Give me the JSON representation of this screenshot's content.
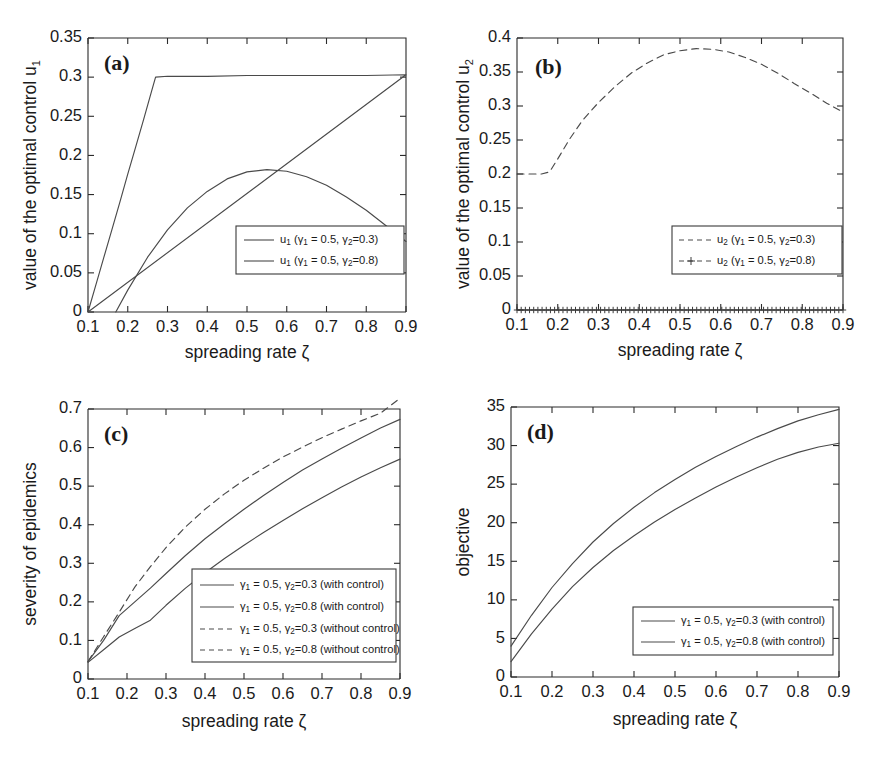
{
  "figure": {
    "title": "",
    "panels": [
      "a",
      "b",
      "c",
      "d"
    ]
  },
  "labels": {
    "xaxis": "spreading rate ζ",
    "panel_a_tag": "(a)",
    "panel_b_tag": "(b)",
    "panel_c_tag": "(c)",
    "panel_d_tag": "(d)",
    "yaxis_a": "value of the optimal control u",
    "yaxis_a_sub": "1",
    "yaxis_b": "value of the optimal control u",
    "yaxis_b_sub": "2",
    "yaxis_c": "severity of epidemics",
    "yaxis_d": "objective"
  },
  "colors": {
    "axis": "#2b2b2b",
    "curve": "#4a4a4a",
    "background": "#ffffff",
    "text": "#1a1a1a"
  },
  "chart_data": [
    {
      "id": "panel-a",
      "type": "line",
      "title": "(a)",
      "xlabel": "spreading rate ζ",
      "ylabel": "value of the optimal control u₁",
      "xlim": [
        0.1,
        0.9
      ],
      "ylim": [
        0,
        0.35
      ],
      "xticks": [
        "0.1",
        "0.2",
        "0.3",
        "0.4",
        "0.5",
        "0.6",
        "0.7",
        "0.8",
        "0.9"
      ],
      "yticks": [
        "0",
        "0.05",
        "0.1",
        "0.15",
        "0.2",
        "0.25",
        "0.3",
        "0.35"
      ],
      "grid": false,
      "legend_position": "lower-right",
      "series": [
        {
          "name": "u₁ (γ₁ = 0.5, γ₂=0.3)",
          "style": "solid",
          "x": [
            0.1,
            0.12,
            0.14,
            0.16,
            0.18,
            0.2,
            0.22,
            0.24,
            0.26,
            0.27,
            0.3,
            0.4,
            0.5,
            0.6,
            0.7,
            0.8,
            0.9
          ],
          "y": [
            0.0,
            0.035,
            0.07,
            0.105,
            0.14,
            0.176,
            0.211,
            0.246,
            0.282,
            0.3,
            0.301,
            0.301,
            0.302,
            0.302,
            0.302,
            0.302,
            0.303
          ]
        },
        {
          "name": "u₁ (γ₁ = 0.5, γ₂=0.8)",
          "style": "solid",
          "x": [
            0.17,
            0.2,
            0.25,
            0.3,
            0.35,
            0.4,
            0.45,
            0.5,
            0.55,
            0.6,
            0.65,
            0.7,
            0.75,
            0.8,
            0.85,
            0.9
          ],
          "y": [
            0.0,
            0.028,
            0.07,
            0.105,
            0.133,
            0.154,
            0.17,
            0.179,
            0.182,
            0.18,
            0.173,
            0.162,
            0.147,
            0.13,
            0.11,
            0.09
          ]
        }
      ]
    },
    {
      "id": "panel-b",
      "type": "line",
      "title": "(b)",
      "xlabel": "spreading rate ζ",
      "ylabel": "value of the optimal control u₂",
      "xlim": [
        0.1,
        0.9
      ],
      "ylim": [
        0,
        0.4
      ],
      "xticks": [
        "0.1",
        "0.2",
        "0.3",
        "0.4",
        "0.5",
        "0.6",
        "0.7",
        "0.8",
        "0.9"
      ],
      "yticks": [
        "0",
        "0.05",
        "0.1",
        "0.15",
        "0.2",
        "0.25",
        "0.3",
        "0.35",
        "0.4"
      ],
      "grid": false,
      "legend_position": "lower-right",
      "series": [
        {
          "name": "u₂ (γ₁ = 0.5, γ₂=0.3)",
          "style": "dashed",
          "x": [
            0.1,
            0.13,
            0.16,
            0.18,
            0.2,
            0.23,
            0.26,
            0.3,
            0.34,
            0.38,
            0.42,
            0.46,
            0.5,
            0.54,
            0.58,
            0.62,
            0.66,
            0.7,
            0.74,
            0.78,
            0.82,
            0.86,
            0.9
          ],
          "y": [
            0.2,
            0.2,
            0.2,
            0.203,
            0.222,
            0.252,
            0.278,
            0.305,
            0.328,
            0.348,
            0.363,
            0.375,
            0.381,
            0.384,
            0.383,
            0.379,
            0.371,
            0.361,
            0.348,
            0.333,
            0.319,
            0.304,
            0.291
          ]
        },
        {
          "name": "u₂ (γ₁ = 0.5, γ₂=0.8)",
          "style": "dashed-plus",
          "x": [
            0.1,
            0.2,
            0.3,
            0.4,
            0.5,
            0.6,
            0.7,
            0.8,
            0.9
          ],
          "y": [
            0.0,
            0.0,
            0.0,
            0.0,
            0.0,
            0.0,
            0.0,
            0.0,
            0.0
          ]
        }
      ]
    },
    {
      "id": "panel-c",
      "type": "line",
      "title": "(c)",
      "xlabel": "spreading rate ζ",
      "ylabel": "severity of epidemics",
      "xlim": [
        0.1,
        0.9
      ],
      "ylim": [
        0,
        0.7
      ],
      "xticks": [
        "0.1",
        "0.2",
        "0.3",
        "0.4",
        "0.5",
        "0.6",
        "0.7",
        "0.8",
        "0.9"
      ],
      "yticks": [
        "0",
        "0.1",
        "0.2",
        "0.3",
        "0.4",
        "0.5",
        "0.6",
        "0.7"
      ],
      "grid": false,
      "legend_position": "lower-right",
      "series": [
        {
          "name": "γ₁ = 0.5, γ₂=0.3 (with control)",
          "style": "solid",
          "x": [
            0.1,
            0.14,
            0.18,
            0.22,
            0.26,
            0.3,
            0.35,
            0.4,
            0.45,
            0.5,
            0.55,
            0.6,
            0.65,
            0.7,
            0.75,
            0.8,
            0.85,
            0.9
          ],
          "y": [
            0.04,
            0.09,
            0.148,
            0.18,
            0.212,
            0.246,
            0.288,
            0.327,
            0.362,
            0.396,
            0.428,
            0.458,
            0.487,
            0.513,
            0.538,
            0.562,
            0.585,
            0.605
          ]
        },
        {
          "name": "γ₁ = 0.5, γ₂=0.8 (with control)",
          "style": "solid",
          "x": [
            0.1,
            0.14,
            0.18,
            0.22,
            0.26,
            0.3,
            0.35,
            0.4,
            0.45,
            0.5,
            0.55,
            0.6,
            0.65,
            0.7,
            0.75,
            0.8,
            0.85,
            0.9
          ],
          "y": [
            0.038,
            0.068,
            0.098,
            0.118,
            0.137,
            0.172,
            0.212,
            0.248,
            0.281,
            0.312,
            0.342,
            0.37,
            0.397,
            0.423,
            0.448,
            0.471,
            0.493,
            0.513
          ]
        },
        {
          "name": "γ₁ = 0.5, γ₂=0.3 (without control)",
          "style": "dashed",
          "x": [
            0.1,
            0.14,
            0.18,
            0.22,
            0.26,
            0.3,
            0.35,
            0.4,
            0.45,
            0.5,
            0.55,
            0.6,
            0.65,
            0.7,
            0.75,
            0.8,
            0.85,
            0.9
          ],
          "y": [
            0.04,
            0.098,
            0.155,
            0.212,
            0.262,
            0.307,
            0.355,
            0.396,
            0.432,
            0.464,
            0.492,
            0.518,
            0.541,
            0.563,
            0.583,
            0.602,
            0.62,
            0.655
          ]
        },
        {
          "name": "γ₁ = 0.5, γ₂=0.8 (without control)",
          "style": "dashed",
          "x": [
            0.1,
            0.14,
            0.18,
            0.22,
            0.26,
            0.3,
            0.35,
            0.4,
            0.45,
            0.5,
            0.55,
            0.6,
            0.65,
            0.7,
            0.75,
            0.8,
            0.85,
            0.9
          ],
          "y": [
            0.04,
            0.098,
            0.155,
            0.212,
            0.262,
            0.307,
            0.355,
            0.396,
            0.432,
            0.464,
            0.492,
            0.518,
            0.541,
            0.563,
            0.583,
            0.602,
            0.62,
            0.655
          ]
        }
      ]
    },
    {
      "id": "panel-d",
      "type": "line",
      "title": "(d)",
      "xlabel": "spreading rate ζ",
      "ylabel": "objective",
      "xlim": [
        0.1,
        0.9
      ],
      "ylim": [
        0,
        35
      ],
      "xticks": [
        "0.1",
        "0.2",
        "0.3",
        "0.4",
        "0.5",
        "0.6",
        "0.7",
        "0.8",
        "0.9"
      ],
      "yticks": [
        "0",
        "5",
        "10",
        "15",
        "20",
        "25",
        "30",
        "35"
      ],
      "grid": false,
      "legend_position": "lower-right",
      "series": [
        {
          "name": "γ₁ = 0.5, γ₂=0.3 (with control)",
          "style": "solid",
          "x": [
            0.1,
            0.15,
            0.2,
            0.25,
            0.3,
            0.35,
            0.4,
            0.45,
            0.5,
            0.55,
            0.6,
            0.65,
            0.7,
            0.75,
            0.8,
            0.85,
            0.9
          ],
          "y": [
            4.0,
            8.0,
            11.6,
            14.7,
            17.5,
            19.9,
            22.0,
            23.9,
            25.6,
            27.2,
            28.6,
            29.9,
            31.1,
            32.2,
            33.2,
            34.0,
            34.7
          ]
        },
        {
          "name": "γ₁ = 0.5, γ₂=0.8 (with control)",
          "style": "solid",
          "x": [
            0.1,
            0.15,
            0.2,
            0.25,
            0.3,
            0.35,
            0.4,
            0.45,
            0.5,
            0.55,
            0.6,
            0.65,
            0.7,
            0.75,
            0.8,
            0.85,
            0.9
          ],
          "y": [
            2.0,
            5.6,
            8.8,
            11.7,
            14.2,
            16.4,
            18.3,
            20.1,
            21.7,
            23.2,
            24.6,
            25.9,
            27.1,
            28.2,
            29.1,
            29.8,
            30.3
          ]
        }
      ]
    }
  ],
  "legends": {
    "panel_a": [
      {
        "marker": "solid",
        "prefix": "u",
        "prefix_sub": "1",
        "text": " (γ",
        "sub1": "1",
        "mid": " = 0.5, γ",
        "sub2": "2",
        "tail": "=0.3)"
      },
      {
        "marker": "solid",
        "prefix": "u",
        "prefix_sub": "1",
        "text": " (γ",
        "sub1": "1",
        "mid": " = 0.5, γ",
        "sub2": "2",
        "tail": "=0.8)"
      }
    ],
    "panel_b": [
      {
        "marker": "dashed",
        "prefix": "u",
        "prefix_sub": "2",
        "text": " (γ",
        "sub1": "1",
        "mid": " = 0.5, γ",
        "sub2": "2",
        "tail": "=0.3)"
      },
      {
        "marker": "dashed-plus",
        "prefix": "u",
        "prefix_sub": "2",
        "text": " (γ",
        "sub1": "1",
        "mid": " = 0.5, γ",
        "sub2": "2",
        "tail": "=0.8)"
      }
    ],
    "panel_c": [
      {
        "marker": "solid",
        "prefix": "γ",
        "prefix_sub": "1",
        "text": " = 0.5, γ",
        "sub2": "2",
        "tail": "=0.3 (with control)"
      },
      {
        "marker": "solid",
        "prefix": "γ",
        "prefix_sub": "1",
        "text": " = 0.5, γ",
        "sub2": "2",
        "tail": "=0.8 (with control)"
      },
      {
        "marker": "dashed",
        "prefix": "γ",
        "prefix_sub": "1",
        "text": " = 0.5, γ",
        "sub2": "2",
        "tail": "=0.3 (without control)"
      },
      {
        "marker": "dashed",
        "prefix": "γ",
        "prefix_sub": "1",
        "text": " = 0.5, γ",
        "sub2": "2",
        "tail": "=0.8 (without control)"
      }
    ],
    "panel_d": [
      {
        "marker": "solid",
        "prefix": "γ",
        "prefix_sub": "1",
        "text": " = 0.5, γ",
        "sub2": "2",
        "tail": "=0.3 (with control)"
      },
      {
        "marker": "solid",
        "prefix": "γ",
        "prefix_sub": "1",
        "text": " = 0.5, γ",
        "sub2": "2",
        "tail": "=0.8 (with control)"
      }
    ]
  }
}
